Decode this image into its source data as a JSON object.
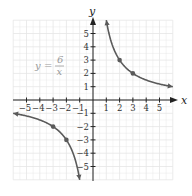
{
  "chart_data": {
    "type": "line",
    "title": "",
    "equation": {
      "lhs": "y",
      "eq": "=",
      "numerator": "6",
      "denominator": "x"
    },
    "xlabel": "x",
    "ylabel": "y",
    "xlim": [
      -6,
      6
    ],
    "ylim": [
      -6,
      6
    ],
    "grid": true,
    "x_tick_labels": [
      "−5",
      "−4",
      "−3",
      "−2",
      "−1",
      "1",
      "2",
      "3",
      "4",
      "5"
    ],
    "y_tick_labels": [
      "5",
      "4",
      "3",
      "2",
      "1",
      "−1",
      "−2",
      "−3",
      "−4",
      "−5"
    ],
    "series": [
      {
        "name": "y = 6/x (x > 0)",
        "x": [
          1,
          2,
          3,
          6
        ],
        "y": [
          6,
          3,
          2,
          1
        ]
      },
      {
        "name": "y = 6/x (x < 0)",
        "x": [
          -6,
          -3,
          -2,
          -1
        ],
        "y": [
          -1,
          -2,
          -3,
          -6
        ]
      }
    ],
    "marked_points": [
      [
        2,
        3
      ],
      [
        3,
        2
      ],
      [
        -3,
        -2
      ],
      [
        -2,
        -3
      ]
    ],
    "colors": {
      "curve": "#5a5a5a",
      "grid": "#e6e6e6",
      "axis": "#222222",
      "equation": "#9a9a9a"
    }
  }
}
